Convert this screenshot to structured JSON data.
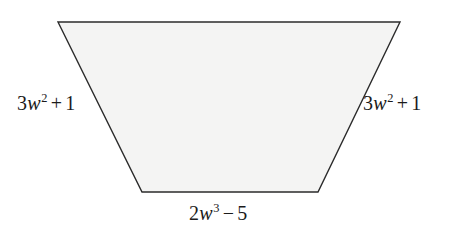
{
  "figure": {
    "type": "trapezoid-diagram",
    "background_color": "#ffffff",
    "fill_color": "#f4f4f3",
    "stroke_color": "#2b2b2b",
    "stroke_width": 1.4,
    "vertices": {
      "top_left": [
        58,
        22
      ],
      "top_right": [
        400,
        22
      ],
      "bottom_right": [
        318,
        192
      ],
      "bottom_left": [
        142,
        192
      ]
    }
  },
  "labels": {
    "left_leg": {
      "text": "3w2 + 1",
      "coefficient": "3",
      "variable": "w",
      "exponent": "2",
      "operator": "+",
      "constant": "1"
    },
    "right_leg": {
      "text": "3w2 + 1",
      "coefficient": "3",
      "variable": "w",
      "exponent": "2",
      "operator": "+",
      "constant": "1"
    },
    "bottom_base": {
      "text": "2w3 − 5",
      "coefficient": "2",
      "variable": "w",
      "exponent": "3",
      "operator": "−",
      "constant": "5"
    }
  }
}
